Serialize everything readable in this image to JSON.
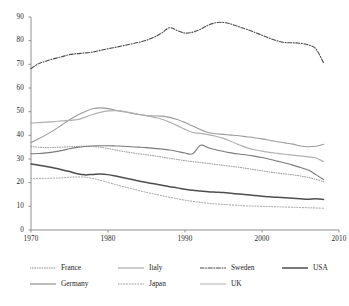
{
  "chart_data": {
    "type": "line",
    "title": "",
    "xlabel": "",
    "ylabel": "",
    "xlim": [
      1970,
      2010
    ],
    "ylim": [
      0,
      90
    ],
    "xticks": [
      "1970",
      "1980",
      "1990",
      "2000",
      "2010"
    ],
    "yticks": [
      "0",
      "10",
      "20",
      "30",
      "40",
      "50",
      "60",
      "70",
      "80",
      "90"
    ],
    "grid": false,
    "legend_position": "bottom",
    "x": [
      1970,
      1971,
      1972,
      1973,
      1974,
      1975,
      1976,
      1977,
      1978,
      1979,
      1980,
      1981,
      1982,
      1983,
      1984,
      1985,
      1986,
      1987,
      1988,
      1989,
      1990,
      1991,
      1992,
      1993,
      1994,
      1995,
      1996,
      1997,
      1998,
      1999,
      2000,
      2001,
      2002,
      2003,
      2004,
      2005,
      2006,
      2007,
      2008
    ],
    "series": [
      {
        "name": "France",
        "style": "dotted-fine",
        "color": "#8c8c8c",
        "width": 1.0,
        "values": [
          35.2,
          35.0,
          34.8,
          34.9,
          35.0,
          35.2,
          35.3,
          35.4,
          35.3,
          35.0,
          34.4,
          33.8,
          33.2,
          32.7,
          32.2,
          31.8,
          31.3,
          30.8,
          30.3,
          29.8,
          29.3,
          28.9,
          28.5,
          28.1,
          27.7,
          27.3,
          26.9,
          26.5,
          26.0,
          25.5,
          25.0,
          24.5,
          24.1,
          23.7,
          23.3,
          22.8,
          22.2,
          21.4,
          20.4
        ]
      },
      {
        "name": "Germany",
        "style": "solid",
        "color": "#7a7a7a",
        "width": 1.1,
        "values": [
          32.2,
          32.3,
          32.6,
          33.0,
          33.6,
          34.3,
          34.9,
          35.3,
          35.5,
          35.6,
          35.6,
          35.5,
          35.4,
          35.2,
          35.0,
          34.8,
          34.5,
          34.2,
          33.8,
          33.2,
          32.5,
          32.2,
          35.8,
          34.8,
          33.9,
          33.2,
          32.6,
          32.1,
          31.7,
          31.2,
          30.6,
          29.9,
          29.1,
          28.3,
          27.4,
          26.4,
          25.3,
          23.4,
          21.3
        ]
      },
      {
        "name": "Italy",
        "style": "solid",
        "color": "#9a9a9a",
        "width": 1.1,
        "values": [
          37.0,
          38.6,
          40.3,
          42.2,
          44.4,
          46.6,
          48.5,
          50.0,
          51.2,
          51.6,
          51.3,
          50.6,
          50.0,
          49.4,
          48.8,
          48.3,
          48.2,
          48.1,
          47.6,
          46.7,
          45.4,
          43.9,
          42.5,
          41.2,
          40.7,
          40.4,
          40.1,
          39.8,
          39.4,
          39.0,
          38.5,
          37.9,
          37.3,
          36.8,
          36.3,
          35.5,
          35.2,
          35.4,
          36.2
        ]
      },
      {
        "name": "Japan",
        "style": "dotted-coarse",
        "color": "#9d9d9d",
        "width": 1.0,
        "values": [
          21.8,
          21.8,
          21.8,
          21.9,
          22.0,
          22.3,
          22.4,
          22.3,
          21.8,
          21.0,
          20.1,
          19.2,
          18.3,
          17.5,
          16.7,
          15.9,
          15.2,
          14.5,
          13.8,
          13.2,
          12.6,
          12.1,
          11.7,
          11.3,
          11.0,
          10.8,
          10.6,
          10.4,
          10.2,
          10.1,
          10.0,
          9.9,
          9.8,
          9.7,
          9.6,
          9.5,
          9.4,
          9.3,
          9.2
        ]
      },
      {
        "name": "Sweden",
        "style": "dash-dot",
        "color": "#4a4a4a",
        "width": 1.1,
        "values": [
          68.2,
          70.3,
          71.4,
          72.4,
          73.2,
          74.1,
          74.5,
          74.8,
          75.2,
          75.9,
          76.6,
          77.2,
          77.9,
          78.6,
          79.3,
          80.2,
          81.5,
          83.3,
          85.5,
          84.3,
          83.2,
          83.6,
          84.8,
          86.5,
          87.6,
          87.7,
          87.0,
          85.9,
          84.8,
          83.6,
          82.3,
          81.0,
          79.9,
          79.2,
          79.1,
          78.9,
          78.2,
          76.5,
          70.6
        ]
      },
      {
        "name": "UK",
        "style": "solid",
        "color": "#b0b0b0",
        "width": 1.2,
        "values": [
          45.2,
          45.4,
          45.6,
          45.8,
          46.1,
          46.3,
          46.6,
          47.6,
          48.8,
          49.7,
          50.3,
          50.4,
          50.1,
          49.5,
          48.9,
          48.3,
          47.6,
          46.8,
          45.6,
          44.1,
          42.5,
          41.2,
          40.8,
          40.3,
          39.6,
          38.7,
          37.4,
          36.0,
          34.8,
          33.9,
          33.3,
          32.8,
          32.4,
          32.0,
          31.6,
          31.3,
          30.9,
          30.4,
          28.9
        ]
      },
      {
        "name": "USA",
        "style": "solid",
        "color": "#4e4e4e",
        "width": 1.5,
        "values": [
          27.9,
          27.4,
          26.8,
          26.2,
          25.5,
          24.7,
          23.8,
          23.3,
          23.5,
          23.7,
          23.4,
          22.8,
          22.1,
          21.4,
          20.7,
          20.1,
          19.5,
          18.9,
          18.3,
          17.8,
          17.2,
          16.8,
          16.5,
          16.2,
          16.0,
          15.8,
          15.5,
          15.2,
          14.9,
          14.6,
          14.3,
          14.0,
          13.8,
          13.6,
          13.4,
          13.2,
          13.0,
          13.2,
          12.9
        ]
      }
    ]
  },
  "legend": {
    "items": [
      {
        "label": "France"
      },
      {
        "label": "Italy"
      },
      {
        "label": "Sweden"
      },
      {
        "label": "USA"
      },
      {
        "label": "Germany"
      },
      {
        "label": "Japan"
      },
      {
        "label": "UK"
      }
    ]
  }
}
